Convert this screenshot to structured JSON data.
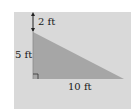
{
  "diagram": {
    "type": "right-triangle-in-rectangle",
    "labels": {
      "top_gap": "2 ft",
      "left_side": "5 ft",
      "bottom_side": "10 ft"
    },
    "colors": {
      "background_box": "#d9d9d9",
      "triangle_fill": "#a6a6a6",
      "line": "#333333",
      "page": "#ffffff"
    },
    "measurements": {
      "gap_above_triangle_ft": 2,
      "triangle_height_ft": 5,
      "triangle_base_ft": 10
    },
    "markers": [
      "right-angle-marker",
      "double-arrow-dimension"
    ]
  }
}
